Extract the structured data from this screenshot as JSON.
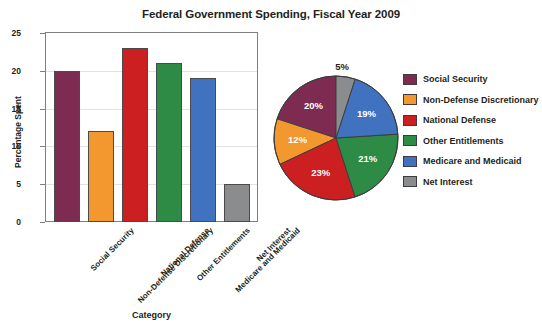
{
  "chart_data": [
    {
      "type": "bar",
      "title": "Federal Government Spending, Fiscal Year 2009",
      "xlabel": "Category",
      "ylabel": "Percentage Spent",
      "categories": [
        "Social Security",
        "Non-Defense Discretionary",
        "National Defense",
        "Other Entitlements",
        "Medicare and Medicaid",
        "Net Interest"
      ],
      "values": [
        20,
        12,
        23,
        21,
        19,
        5
      ],
      "ylim": [
        0,
        25
      ],
      "yticks": [
        0,
        5,
        10,
        15,
        20,
        25
      ],
      "grid": true,
      "legend": false,
      "colors": [
        "#7E2B52",
        "#F2982F",
        "#CC1F22",
        "#2E8B45",
        "#4172C0",
        "#8A8C8E"
      ]
    },
    {
      "type": "pie",
      "title": "",
      "labels": [
        "Net Interest",
        "Medicare and Medicaid",
        "Other Entitlements",
        "National Defense",
        "Non-Defense Discretionary",
        "Social Security"
      ],
      "values": [
        5,
        19,
        21,
        23,
        12,
        20
      ],
      "data_labels": [
        "5%",
        "19%",
        "21%",
        "23%",
        "12%",
        "20%"
      ],
      "colors": [
        "#8A8C8E",
        "#4172C0",
        "#2E8B45",
        "#CC1F22",
        "#F2982F",
        "#7E2B52"
      ],
      "startangle": 90,
      "counterclock": false,
      "legend": true,
      "legend_position": "right"
    }
  ],
  "title": "Federal Government Spending, Fiscal Year 2009",
  "axes": {
    "y_label": "Percentage Spent",
    "x_label": "Category",
    "y_ticks": [
      "0",
      "5",
      "10",
      "15",
      "20",
      "25"
    ]
  },
  "bars": [
    {
      "label": "Social Security",
      "value": 20,
      "color": "#7E2B52"
    },
    {
      "label": "Non-Defense Discretionary",
      "value": 12,
      "color": "#F2982F"
    },
    {
      "label": "National Defense",
      "value": 23,
      "color": "#CC1F22"
    },
    {
      "label": "Other Entitlements",
      "value": 21,
      "color": "#2E8B45"
    },
    {
      "label": "Medicare and Medicaid",
      "value": 19,
      "color": "#4172C0"
    },
    {
      "label": "Net Interest",
      "value": 5,
      "color": "#8A8C8E"
    }
  ],
  "pie": {
    "slices": [
      {
        "label": "Net Interest",
        "pct": "5%",
        "value": 5,
        "color": "#8A8C8E"
      },
      {
        "label": "Medicare and Medicaid",
        "pct": "19%",
        "value": 19,
        "color": "#4172C0"
      },
      {
        "label": "Other Entitlements",
        "pct": "21%",
        "value": 21,
        "color": "#2E8B45"
      },
      {
        "label": "National Defense",
        "pct": "23%",
        "value": 23,
        "color": "#CC1F22"
      },
      {
        "label": "Non-Defense Discretionary",
        "pct": "12%",
        "value": 12,
        "color": "#F2982F"
      },
      {
        "label": "Social Security",
        "pct": "20%",
        "value": 20,
        "color": "#7E2B52"
      }
    ]
  },
  "legend": {
    "items": [
      {
        "label": "Social Security",
        "color": "#7E2B52"
      },
      {
        "label": "Non-Defense Discretionary",
        "color": "#F2982F"
      },
      {
        "label": "National Defense",
        "color": "#CC1F22"
      },
      {
        "label": "Other Entitlements",
        "color": "#2E8B45"
      },
      {
        "label": "Medicare and Medicaid",
        "color": "#4172C0"
      },
      {
        "label": "Net Interest",
        "color": "#8A8C8E"
      }
    ]
  }
}
